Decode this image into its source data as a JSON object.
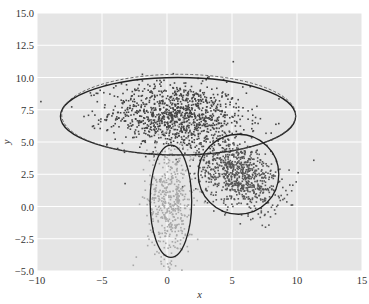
{
  "chart_data": {
    "type": "scatter",
    "title": "",
    "xlabel": "x",
    "ylabel": "y",
    "xlim": [
      -10,
      15
    ],
    "ylim": [
      -5,
      15
    ],
    "xticks": [
      -10,
      -5,
      0,
      5,
      10,
      15
    ],
    "xtick_labels": [
      "−10",
      "−5",
      "0",
      "5",
      "10",
      "15"
    ],
    "yticks": [
      -5.0,
      -2.5,
      0.0,
      2.5,
      5.0,
      7.5,
      10.0,
      12.5,
      15.0
    ],
    "ytick_labels": [
      "−5.0",
      "−2.5",
      "0.0",
      "2.5",
      "5.0",
      "7.5",
      "10.0",
      "12.5",
      "15.0"
    ],
    "grid": true,
    "legend": null,
    "background": "#e5e5e5",
    "grid_color": "#ffffff",
    "series": [
      {
        "name": "cluster-1",
        "color": "#444444",
        "n": 1100,
        "mean": [
          0.8,
          7.0
        ],
        "std": [
          2.6,
          1.3
        ],
        "rho": -0.1
      },
      {
        "name": "cluster-2",
        "color": "#a8a8a8",
        "n": 500,
        "mean": [
          0.3,
          0.5
        ],
        "std": [
          0.9,
          2.4
        ],
        "rho": 0.0
      },
      {
        "name": "cluster-3",
        "color": "#555555",
        "n": 800,
        "mean": [
          5.5,
          2.5
        ],
        "std": [
          1.6,
          1.4
        ],
        "rho": -0.35
      }
    ],
    "ellipses": [
      {
        "name": "fit-1",
        "center": [
          0.85,
          7.0
        ],
        "rx": 9.05,
        "ry": 3.0,
        "angle": 0,
        "style": "solid"
      },
      {
        "name": "true-1",
        "center": [
          0.9,
          7.1
        ],
        "rx": 9.0,
        "ry": 3.15,
        "angle": 0,
        "style": "dashed"
      },
      {
        "name": "fit-2",
        "center": [
          0.3,
          0.4
        ],
        "rx": 1.6,
        "ry": 4.35,
        "angle": 0,
        "style": "solid"
      },
      {
        "name": "fit-3",
        "center": [
          5.5,
          2.5
        ],
        "rx": 3.1,
        "ry": 3.1,
        "angle": 0,
        "style": "solid"
      }
    ]
  }
}
